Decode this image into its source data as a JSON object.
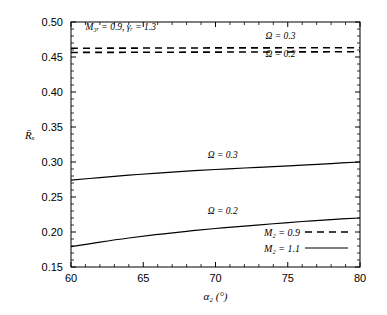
{
  "chart_data": {
    "type": "line",
    "title": "",
    "xlabel": "α₂ (°)",
    "ylabel": "R̄ₓ",
    "xlim": [
      60,
      80
    ],
    "ylim": [
      0.15,
      0.5
    ],
    "xticks": [
      60,
      65,
      70,
      75,
      80
    ],
    "xtick_labels": [
      "60",
      "65",
      "70",
      "75",
      "80"
    ],
    "yticks": [
      0.15,
      0.2,
      0.25,
      0.3,
      0.35,
      0.4,
      0.45,
      0.5
    ],
    "ytick_labels": [
      "0.15",
      "0.20",
      "0.25",
      "0.30",
      "0.35",
      "0.40",
      "0.45",
      "0.50"
    ],
    "minor_ticks_per_interval": 5,
    "grid": false,
    "legend_position": "lower right",
    "frame": true,
    "series": [
      {
        "name": "M2 = 0.9, Ω = 0.3",
        "style": "dashed",
        "omega": 0.3,
        "mach": 0.9,
        "x": [
          60,
          62,
          64,
          66,
          68,
          70,
          72,
          74,
          76,
          78,
          80
        ],
        "values": [
          0.4625,
          0.4626,
          0.4627,
          0.4628,
          0.4629,
          0.463,
          0.463,
          0.4631,
          0.4632,
          0.4632,
          0.4633
        ]
      },
      {
        "name": "M2 = 0.9, Ω = 0.2",
        "style": "dashed",
        "omega": 0.2,
        "mach": 0.9,
        "x": [
          60,
          62,
          64,
          66,
          68,
          70,
          72,
          74,
          76,
          78,
          80
        ],
        "values": [
          0.4565,
          0.4566,
          0.4567,
          0.4568,
          0.4569,
          0.457,
          0.4571,
          0.4572,
          0.4573,
          0.4574,
          0.4575
        ]
      },
      {
        "name": "M2 = 1.1, Ω = 0.3",
        "style": "solid",
        "omega": 0.3,
        "mach": 1.1,
        "x": [
          60,
          62,
          64,
          66,
          68,
          70,
          72,
          74,
          76,
          78,
          80
        ],
        "values": [
          0.274,
          0.2778,
          0.2812,
          0.2842,
          0.2869,
          0.2893,
          0.2914,
          0.2935,
          0.2955,
          0.2978,
          0.3
        ]
      },
      {
        "name": "M2 = 1.1, Ω = 0.2",
        "style": "solid",
        "omega": 0.2,
        "mach": 1.1,
        "x": [
          60,
          62,
          64,
          66,
          68,
          70,
          72,
          74,
          76,
          78,
          80
        ],
        "values": [
          0.179,
          0.1855,
          0.1914,
          0.1965,
          0.201,
          0.205,
          0.2085,
          0.2118,
          0.215,
          0.2178,
          0.22
        ]
      }
    ],
    "annotations": [
      {
        "name": "parameters",
        "text": "M₃ᵣ = 0.9,  γᵣ = 1.3",
        "x": 61.0,
        "y": 0.488
      },
      {
        "name": "omega-dashed-upper",
        "text": "Ω = 0.3",
        "x": 74.5,
        "y": 0.476
      },
      {
        "name": "omega-dashed-lower",
        "text": "Ω = 0.2",
        "x": 74.5,
        "y": 0.4495
      },
      {
        "name": "omega-solid-upper",
        "text": "Ω = 0.3",
        "x": 70.5,
        "y": 0.3055
      },
      {
        "name": "omega-solid-lower",
        "text": "Ω = 0.2",
        "x": 70.5,
        "y": 0.2255
      }
    ],
    "legend": [
      {
        "label": "M₂ = 0.9",
        "style": "dashed"
      },
      {
        "label": "M₂ = 1.1",
        "style": "solid"
      }
    ]
  }
}
